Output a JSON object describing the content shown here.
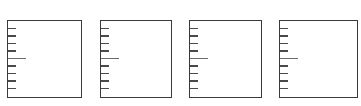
{
  "diagram": {
    "stroke_color": "#3a3a3a",
    "tick_color": "#4a4a4a",
    "long_tick_color": "#6a6a6a",
    "panels": [
      {
        "id": 1,
        "x": 7,
        "y": 20,
        "width": 75,
        "height": 78
      },
      {
        "id": 2,
        "x": 100,
        "y": 20,
        "width": 72,
        "height": 78
      },
      {
        "id": 3,
        "x": 189,
        "y": 20,
        "width": 73,
        "height": 78
      },
      {
        "id": 4,
        "x": 279,
        "y": 20,
        "width": 79,
        "height": 78
      }
    ],
    "scale": {
      "divisions": 10,
      "tick_count": 9,
      "long_tick_index": 4,
      "short_tick_length": 8,
      "long_tick_length": 18
    }
  }
}
